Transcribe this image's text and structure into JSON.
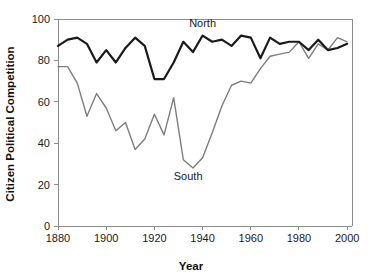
{
  "chart_data": {
    "type": "line",
    "title": "",
    "xlabel": "Year",
    "ylabel": "Citizen Political Competition",
    "xlim": [
      1880,
      2002
    ],
    "ylim": [
      0,
      100
    ],
    "xticks": [
      1880,
      1900,
      1920,
      1940,
      1960,
      1980,
      2000
    ],
    "xtick_labels": [
      "1880",
      "1900",
      "1920",
      "1940",
      "1960",
      "1980",
      "2000"
    ],
    "yticks": [
      0,
      20,
      40,
      60,
      80,
      100
    ],
    "ytick_labels": [
      "0",
      "20",
      "40",
      "60",
      "80",
      "100"
    ],
    "grid": false,
    "legend": "inline-annotations",
    "series": [
      {
        "name": "North",
        "color": "#1a1a1a",
        "line_width": 2.2,
        "label_x": 1940,
        "label_y": 96,
        "x": [
          1880,
          1884,
          1888,
          1892,
          1896,
          1900,
          1904,
          1908,
          1912,
          1916,
          1920,
          1924,
          1928,
          1932,
          1936,
          1940,
          1944,
          1948,
          1952,
          1956,
          1960,
          1964,
          1968,
          1972,
          1976,
          1980,
          1984,
          1988,
          1992,
          1996,
          2000
        ],
        "values": [
          87,
          90,
          91,
          88,
          79,
          85,
          79,
          86,
          91,
          87,
          71,
          71,
          79,
          89,
          84,
          92,
          89,
          90,
          87,
          92,
          91,
          81,
          91,
          88,
          89,
          89,
          85,
          90,
          85,
          86,
          88
        ]
      },
      {
        "name": "South",
        "color": "#7d7d7d",
        "line_width": 1.4,
        "label_x": 1934,
        "label_y": 22,
        "x": [
          1880,
          1884,
          1888,
          1892,
          1896,
          1900,
          1904,
          1908,
          1912,
          1916,
          1920,
          1924,
          1928,
          1932,
          1936,
          1940,
          1944,
          1948,
          1952,
          1956,
          1960,
          1964,
          1968,
          1972,
          1976,
          1980,
          1984,
          1988,
          1992,
          1996,
          2000
        ],
        "values": [
          77,
          77,
          69,
          53,
          64,
          57,
          46,
          50,
          37,
          42,
          54,
          44,
          62,
          32,
          28,
          33,
          45,
          58,
          68,
          70,
          69,
          76,
          82,
          83,
          84,
          89,
          81,
          88,
          85,
          91,
          89
        ]
      }
    ]
  },
  "axes": {
    "x_axis_title": "Year",
    "y_axis_title": "Citizen Political Competition"
  }
}
